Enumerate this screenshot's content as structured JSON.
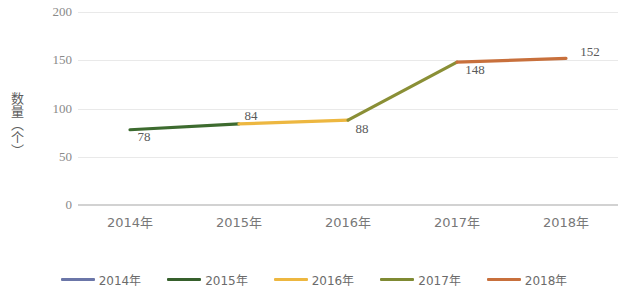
{
  "chart_data": {
    "type": "line",
    "title": "",
    "xlabel": "",
    "ylabel": "数量（个）",
    "categories": [
      "2014年",
      "2015年",
      "2016年",
      "2017年",
      "2018年"
    ],
    "values": [
      78,
      84,
      88,
      148,
      152
    ],
    "point_labels": [
      "78",
      "84",
      "88",
      "148",
      "152"
    ],
    "ylim": [
      0,
      200
    ],
    "yticks": [
      200,
      150,
      100,
      50,
      0
    ],
    "ytick_labels": [
      "200",
      "150",
      "100",
      "50",
      "0"
    ],
    "grid": true,
    "legend_position": "bottom",
    "segment_colors": [
      "#3d6b2f",
      "#edb740",
      "#8a8f36",
      "#c8703c"
    ],
    "series": [
      {
        "name": "数量（个）",
        "values": [
          78,
          84,
          88,
          148,
          152
        ]
      }
    ],
    "legend": [
      {
        "label": "2014年",
        "color": "#6b76a8"
      },
      {
        "label": "2015年",
        "color": "#36602c"
      },
      {
        "label": "2016年",
        "color": "#edb740"
      },
      {
        "label": "2017年",
        "color": "#7f8a33"
      },
      {
        "label": "2018年",
        "color": "#c8703c"
      }
    ]
  }
}
